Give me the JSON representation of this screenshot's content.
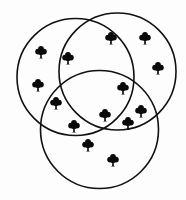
{
  "diagram": {
    "type": "venn",
    "colors": {
      "background": "#fdfdfd",
      "stroke": "#111111",
      "tree": "#0a0a0a"
    },
    "circles": [
      {
        "id": "circle-top-left",
        "cx": 75.5,
        "cy": 77,
        "r": 58.5
      },
      {
        "id": "circle-top-right",
        "cx": 117.5,
        "cy": 71.5,
        "r": 58.5
      },
      {
        "id": "circle-bottom",
        "cx": 99.5,
        "cy": 129.5,
        "r": 59
      }
    ],
    "icon": "tree-icon",
    "trees": [
      {
        "x": 41,
        "y": 52,
        "region": "top-left only"
      },
      {
        "x": 38,
        "y": 85,
        "region": "top-left only"
      },
      {
        "x": 68,
        "y": 58,
        "region": "top-left and top-right"
      },
      {
        "x": 111,
        "y": 38,
        "region": "top-right only"
      },
      {
        "x": 145,
        "y": 38,
        "region": "top-right only"
      },
      {
        "x": 158,
        "y": 68,
        "region": "top-right only"
      },
      {
        "x": 123,
        "y": 88,
        "region": "all three"
      },
      {
        "x": 56,
        "y": 103,
        "region": "top-left and bottom"
      },
      {
        "x": 141,
        "y": 111,
        "region": "top-right and bottom"
      },
      {
        "x": 105,
        "y": 115,
        "region": "all three"
      },
      {
        "x": 74,
        "y": 126,
        "region": "top-left and bottom"
      },
      {
        "x": 128,
        "y": 123,
        "region": "top-right and bottom"
      },
      {
        "x": 88,
        "y": 145,
        "region": "bottom only"
      },
      {
        "x": 113,
        "y": 160,
        "region": "bottom only"
      }
    ],
    "tree_count": 14
  }
}
